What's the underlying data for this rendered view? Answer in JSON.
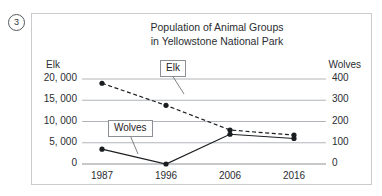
{
  "question": {
    "number": "3"
  },
  "chart_data": {
    "type": "line",
    "title_line1": "Population of Animal Groups",
    "title_line2": "in Yellowstone National Park",
    "xlabel": "",
    "categories": [
      "1987",
      "1996",
      "2006",
      "2016"
    ],
    "grid": true,
    "legend_position": "inline-callout",
    "axes": {
      "left": {
        "label": "Elk",
        "ticks": [
          "0",
          "5, 000",
          "10, 000",
          "15, 000",
          "20, 000"
        ],
        "tick_values": [
          0,
          5000,
          10000,
          15000,
          20000
        ],
        "ylim": [
          0,
          20000
        ]
      },
      "right": {
        "label": "Wolves",
        "ticks": [
          "0",
          "100",
          "200",
          "300",
          "400"
        ],
        "tick_values": [
          0,
          100,
          200,
          300,
          400
        ],
        "ylim": [
          0,
          400
        ]
      }
    },
    "series": [
      {
        "name": "Elk",
        "axis": "left",
        "style": "dashed",
        "color": "#1b1e21",
        "values": [
          19000,
          13800,
          8000,
          6800
        ]
      },
      {
        "name": "Wolves",
        "axis": "right",
        "style": "solid",
        "color": "#1b1e21",
        "values": [
          70,
          0,
          140,
          120
        ]
      }
    ],
    "annotations": [
      {
        "text": "Elk",
        "target_series": "Elk"
      },
      {
        "text": "Wolves",
        "target_series": "Wolves"
      }
    ]
  }
}
